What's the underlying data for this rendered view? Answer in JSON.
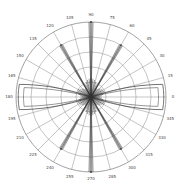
{
  "chart_data": {
    "type": "polar",
    "title": "",
    "center": [
      91,
      97
    ],
    "outer_radius_px": 75,
    "rings": 5,
    "grid": true,
    "angle_ticks": [
      0,
      15,
      30,
      45,
      60,
      75,
      90,
      105,
      120,
      135,
      150,
      165,
      180,
      195,
      210,
      225,
      240,
      255,
      270,
      285,
      300,
      315,
      330,
      345
    ],
    "angle_labels": [
      "0",
      "15",
      "30",
      "45",
      "60",
      "75",
      "90",
      "105",
      "120",
      "135",
      "150",
      "165",
      "180",
      "195",
      "210",
      "225",
      "240",
      "255",
      "270",
      "285",
      "300",
      "315",
      "330",
      "345"
    ],
    "series": [
      {
        "name": "horizontal-lobe",
        "description": "Broad flat-topped lobe toward 0 and 180 degrees reaching near outer ring",
        "theta": [
          0,
          5,
          10,
          15,
          20,
          165,
          170,
          175,
          180,
          185,
          190,
          195,
          200,
          340,
          345,
          350,
          355
        ],
        "r_fraction": [
          0.97,
          0.97,
          0.95,
          0.55,
          0.1,
          0.55,
          0.95,
          0.97,
          0.97,
          0.97,
          0.95,
          0.55,
          0.1,
          0.1,
          0.55,
          0.95,
          0.97
        ]
      },
      {
        "name": "spikes",
        "description": "Narrow radial spikes",
        "theta": [
          60,
          90,
          120,
          240,
          270,
          300
        ],
        "r_fraction": [
          0.8,
          1.0,
          0.8,
          0.8,
          1.0,
          0.8
        ]
      },
      {
        "name": "center-cluster",
        "description": "Dense short radial strokes near origin",
        "theta": [
          30,
          45,
          75,
          105,
          135,
          150,
          210,
          225,
          255,
          285,
          315,
          330
        ],
        "r_fraction": [
          0.2,
          0.18,
          0.25,
          0.25,
          0.18,
          0.2,
          0.2,
          0.18,
          0.25,
          0.25,
          0.18,
          0.2
        ]
      }
    ],
    "colors": {
      "grid": "#8a8a8a",
      "trace": "#333333",
      "label": "#444444"
    }
  }
}
